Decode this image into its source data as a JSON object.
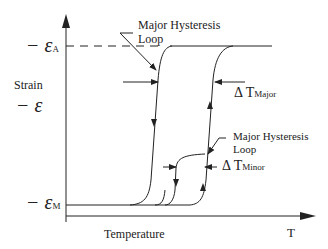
{
  "diagram": {
    "type": "shape memory alloy strain-temperature hysteresis",
    "y_axis": {
      "label": "Strain",
      "symbol": "− ε",
      "ticks": [
        {
          "prefix": "− ε",
          "sub": "A"
        },
        {
          "prefix": "− ε",
          "sub": "M"
        }
      ]
    },
    "x_axis": {
      "label": "Temperature",
      "end_label": "T"
    },
    "annotations": {
      "major_loop_top": "Major Hysteresis\nLoop",
      "major_loop_top_line1": "Major Hysteresis",
      "major_loop_top_line2": "Loop",
      "delta_major_prefix": "Δ T",
      "delta_major_sub": "Major",
      "major_loop_mid_line1": "Major Hysteresis",
      "major_loop_mid_line2": "Loop",
      "delta_minor_prefix": "Δ T",
      "delta_minor_sub": "Minor"
    },
    "colors": {
      "line": "#222222",
      "background": "#ffffff"
    }
  }
}
